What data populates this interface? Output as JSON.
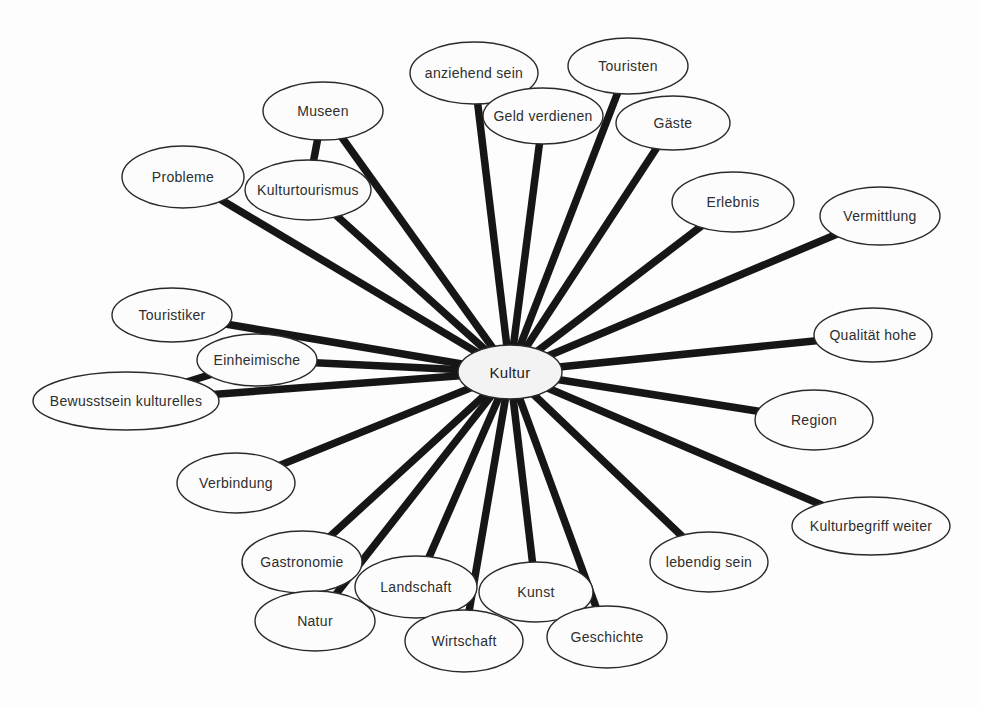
{
  "diagram": {
    "type": "concept-map",
    "colors": {
      "background": "#fdfdfd",
      "line": "#161616",
      "node_fill": "#fcfcfc",
      "center_fill": "#f3f3f3",
      "node_stroke": "#2a2a2a",
      "text": "#2e2e2e"
    },
    "line_width": 7.5,
    "node_stroke_width": 1.4,
    "center_node": {
      "id": "kultur",
      "label": "Kultur",
      "x": 510,
      "y": 372,
      "rx": 52,
      "ry": 27
    },
    "nodes": [
      {
        "id": "anziehend-sein",
        "label": "anziehend sein",
        "x": 474,
        "y": 73,
        "rx": 64,
        "ry": 31
      },
      {
        "id": "touristen",
        "label": "Touristen",
        "x": 628,
        "y": 66,
        "rx": 60,
        "ry": 28
      },
      {
        "id": "museen",
        "label": "Museen",
        "x": 323,
        "y": 111,
        "rx": 60,
        "ry": 29
      },
      {
        "id": "geld-verdienen",
        "label": "Geld verdienen",
        "x": 543,
        "y": 116,
        "rx": 60,
        "ry": 28
      },
      {
        "id": "gaeste",
        "label": "Gäste",
        "x": 673,
        "y": 123,
        "rx": 57,
        "ry": 27
      },
      {
        "id": "probleme",
        "label": "Probleme",
        "x": 183,
        "y": 177,
        "rx": 61,
        "ry": 31
      },
      {
        "id": "erlebnis",
        "label": "Erlebnis",
        "x": 733,
        "y": 202,
        "rx": 61,
        "ry": 30
      },
      {
        "id": "vermittlung",
        "label": "Vermittlung",
        "x": 880,
        "y": 216,
        "rx": 60,
        "ry": 29
      },
      {
        "id": "kulturtourismus",
        "label": "Kulturtourismus",
        "x": 308,
        "y": 190,
        "rx": 63,
        "ry": 30
      },
      {
        "id": "touristiker",
        "label": "Touristiker",
        "x": 172,
        "y": 315,
        "rx": 60,
        "ry": 27
      },
      {
        "id": "einheimische",
        "label": "Einheimische",
        "x": 257,
        "y": 360,
        "rx": 60,
        "ry": 26
      },
      {
        "id": "bewusstsein-kulturelles",
        "label": "Bewusstsein kulturelles",
        "x": 126,
        "y": 401,
        "rx": 93,
        "ry": 29
      },
      {
        "id": "qualitaet-hohe",
        "label": "Qualität hohe",
        "x": 873,
        "y": 335,
        "rx": 59,
        "ry": 27
      },
      {
        "id": "region",
        "label": "Region",
        "x": 814,
        "y": 420,
        "rx": 59,
        "ry": 30
      },
      {
        "id": "verbindung",
        "label": "Verbindung",
        "x": 236,
        "y": 483,
        "rx": 59,
        "ry": 30
      },
      {
        "id": "kulturbegriff-weiter",
        "label": "Kulturbegriff weiter",
        "x": 871,
        "y": 526,
        "rx": 79,
        "ry": 29
      },
      {
        "id": "lebendig-sein",
        "label": "lebendig sein",
        "x": 709,
        "y": 562,
        "rx": 59,
        "ry": 30
      },
      {
        "id": "gastronomie",
        "label": "Gastronomie",
        "x": 302,
        "y": 562,
        "rx": 60,
        "ry": 31
      },
      {
        "id": "natur",
        "label": "Natur",
        "x": 315,
        "y": 621,
        "rx": 60,
        "ry": 30
      },
      {
        "id": "landschaft",
        "label": "Landschaft",
        "x": 416,
        "y": 587,
        "rx": 61,
        "ry": 31
      },
      {
        "id": "kunst",
        "label": "Kunst",
        "x": 536,
        "y": 592,
        "rx": 57,
        "ry": 30
      },
      {
        "id": "wirtschaft",
        "label": "Wirtschaft",
        "x": 464,
        "y": 641,
        "rx": 59,
        "ry": 31
      },
      {
        "id": "geschichte",
        "label": "Geschichte",
        "x": 607,
        "y": 637,
        "rx": 60,
        "ry": 31
      }
    ],
    "edges": [
      {
        "from": "anziehend-sein",
        "to": "kultur"
      },
      {
        "from": "touristen",
        "to": "kultur"
      },
      {
        "from": "museen",
        "to": "kultur"
      },
      {
        "from": "geld-verdienen",
        "to": "kultur"
      },
      {
        "from": "gaeste",
        "to": "kultur"
      },
      {
        "from": "probleme",
        "to": "kultur"
      },
      {
        "from": "erlebnis",
        "to": "kultur"
      },
      {
        "from": "vermittlung",
        "to": "kultur"
      },
      {
        "from": "kulturtourismus",
        "to": "kultur"
      },
      {
        "from": "touristiker",
        "to": "kultur"
      },
      {
        "from": "einheimische",
        "to": "kultur"
      },
      {
        "from": "bewusstsein-kulturelles",
        "to": "kultur"
      },
      {
        "from": "qualitaet-hohe",
        "to": "kultur"
      },
      {
        "from": "region",
        "to": "kultur"
      },
      {
        "from": "verbindung",
        "to": "kultur"
      },
      {
        "from": "kulturbegriff-weiter",
        "to": "kultur"
      },
      {
        "from": "lebendig-sein",
        "to": "kultur"
      },
      {
        "from": "gastronomie",
        "to": "kultur"
      },
      {
        "from": "natur",
        "to": "kultur"
      },
      {
        "from": "landschaft",
        "to": "kultur"
      },
      {
        "from": "kunst",
        "to": "kultur"
      },
      {
        "from": "wirtschaft",
        "to": "kultur"
      },
      {
        "from": "geschichte",
        "to": "kultur"
      },
      {
        "from": "museen",
        "to": "kulturtourismus"
      },
      {
        "from": "einheimische",
        "to": "bewusstsein-kulturelles"
      }
    ]
  }
}
